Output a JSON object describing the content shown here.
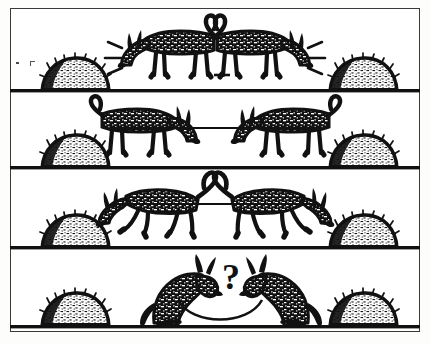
{
  "image": {
    "title": "Two Donkeys and Two Haystacks",
    "medium": "black and white line-art cartoon",
    "palette": {
      "ink": "#111111",
      "paper": "#ffffff",
      "page_background": "#fbfbfa",
      "border": "#3a3a3a"
    },
    "border": {
      "present": true,
      "style": "thin rectangular rule inset from page edge"
    }
  },
  "panels": [
    {
      "index": 1,
      "name": "panel-strain-apart",
      "caption": "",
      "ground_line_y": 91,
      "description": "Two donkeys tied together by a short rope strain in opposite directions, each reaching toward its own haystack.",
      "haystacks": 2,
      "donkeys": 2,
      "effect_lines": {
        "present": true,
        "count_each_side": 3,
        "meaning": "straining / desire"
      }
    },
    {
      "index": 2,
      "name": "panel-stalemate",
      "caption": "",
      "ground_line_y": 168,
      "description": "Both donkeys stand still with the rope stretched taut between them, neither able to reach its haystack.",
      "haystacks": 2,
      "donkeys": 2,
      "effect_lines": {
        "present": false,
        "count_each_side": 0,
        "meaning": ""
      }
    },
    {
      "index": 3,
      "name": "panel-pulling-hard",
      "caption": "",
      "ground_line_y": 248,
      "description": "The donkeys lunge hard away from each other, heads down and legs splayed, still held back by the rope.",
      "haystacks": 2,
      "donkeys": 2,
      "effect_lines": {
        "present": false,
        "count_each_side": 0,
        "meaning": ""
      }
    },
    {
      "index": 4,
      "name": "panel-question",
      "caption": "",
      "ground_line_y": 327,
      "description": "The two donkeys sit facing each other with a large question mark between them, pausing to think.",
      "haystacks": 2,
      "donkeys": 2,
      "effect_lines": {
        "present": false,
        "count_each_side": 0,
        "meaning": ""
      },
      "symbol": {
        "glyph": "?",
        "name": "question-mark",
        "style": "bold serif"
      }
    }
  ],
  "artifacts": {
    "scan_specks": [
      {
        "name": "speck-left-upper",
        "x": 16,
        "y": 62
      },
      {
        "name": "speck-left-cross",
        "x": 30,
        "y": 61
      }
    ]
  }
}
